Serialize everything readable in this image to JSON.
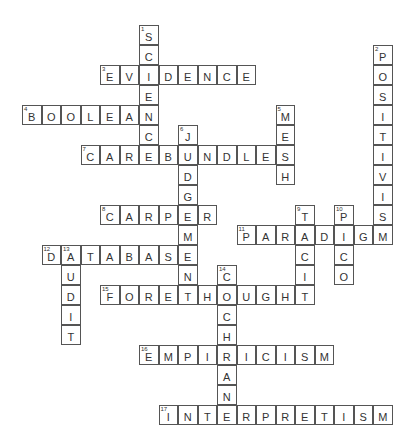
{
  "puzzle": {
    "type": "crossword",
    "grid": {
      "origin_x": 22,
      "origin_y": 25,
      "cell_w": 19.5,
      "cell_h": 20
    },
    "entries": [
      {
        "number": 1,
        "direction": "down",
        "answer": "SCIENCE",
        "row": 0,
        "col": 6
      },
      {
        "number": 2,
        "direction": "down",
        "answer": "POSITIVISM",
        "row": 1,
        "col": 18
      },
      {
        "number": 3,
        "direction": "across",
        "answer": "EVIDENCE",
        "row": 2,
        "col": 4
      },
      {
        "number": 4,
        "direction": "across",
        "answer": "BOOLEAN",
        "row": 4,
        "col": 0
      },
      {
        "number": 5,
        "direction": "down",
        "answer": "MESH",
        "row": 4,
        "col": 13
      },
      {
        "number": 6,
        "direction": "down",
        "answer": "JUDGEMENT",
        "row": 5,
        "col": 8
      },
      {
        "number": 7,
        "direction": "across",
        "answer": "CAREBUNDLES",
        "row": 6,
        "col": 3
      },
      {
        "number": 8,
        "direction": "across",
        "answer": "CARPER",
        "row": 9,
        "col": 4
      },
      {
        "number": 9,
        "direction": "down",
        "answer": "TACIT",
        "row": 9,
        "col": 14
      },
      {
        "number": 10,
        "direction": "down",
        "answer": "PICO",
        "row": 9,
        "col": 16
      },
      {
        "number": 11,
        "direction": "across",
        "answer": "PARADIGM",
        "row": 10,
        "col": 11
      },
      {
        "number": 12,
        "direction": "across",
        "answer": "DATABASE",
        "row": 11,
        "col": 1
      },
      {
        "number": 13,
        "direction": "down",
        "answer": "AUDIT",
        "row": 11,
        "col": 2
      },
      {
        "number": 14,
        "direction": "down",
        "answer": "COCHRAN",
        "row": 12,
        "col": 10
      },
      {
        "number": 15,
        "direction": "across",
        "answer": "FORETHOUGHT",
        "row": 13,
        "col": 4
      },
      {
        "number": 16,
        "direction": "across",
        "answer": "EMPIRICISM",
        "row": 16,
        "col": 6
      },
      {
        "number": 17,
        "direction": "across",
        "answer": "INTERPRETISM",
        "row": 19,
        "col": 7
      }
    ]
  }
}
